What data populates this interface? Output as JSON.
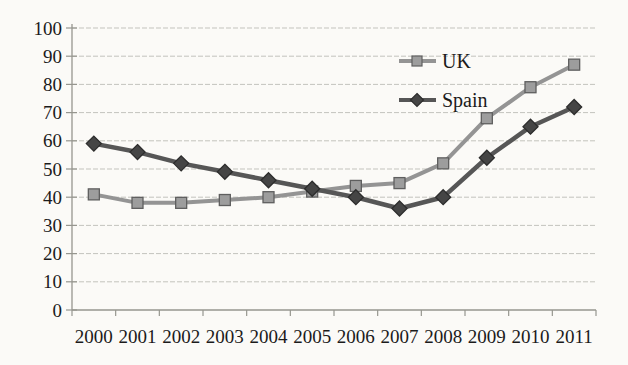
{
  "chart_data": {
    "type": "line",
    "title": "",
    "xlabel": "",
    "ylabel": "",
    "categories": [
      "2000",
      "2001",
      "2002",
      "2003",
      "2004",
      "2005",
      "2006",
      "2007",
      "2008",
      "2009",
      "2010",
      "2011"
    ],
    "series": [
      {
        "name": "UK",
        "values": [
          41,
          38,
          38,
          39,
          40,
          42,
          44,
          45,
          52,
          68,
          79,
          87
        ],
        "color": "#949494",
        "marker": "square",
        "marker_fill": "#9d9d9d",
        "marker_stroke": "#5f5f5f",
        "line_width": 4
      },
      {
        "name": "Spain",
        "values": [
          59,
          56,
          52,
          49,
          46,
          43,
          40,
          36,
          40,
          54,
          65,
          72
        ],
        "color": "#565656",
        "marker": "diamond",
        "marker_fill": "#454545",
        "marker_stroke": "#2d2d2d",
        "line_width": 4.5
      }
    ],
    "ylim": [
      0,
      100
    ],
    "ytick_step": 10,
    "yticks": [
      "0",
      "10",
      "20",
      "30",
      "40",
      "50",
      "60",
      "70",
      "80",
      "90",
      "100"
    ],
    "grid": true,
    "gridlines": "horizontal-dashed",
    "legend_position": "inside-upper-right",
    "legend_border": false
  },
  "colors": {
    "background": "#fbfaf7",
    "text": "#1b1b1b",
    "axis": "#96968f",
    "gridline": "#c3c3bd"
  }
}
